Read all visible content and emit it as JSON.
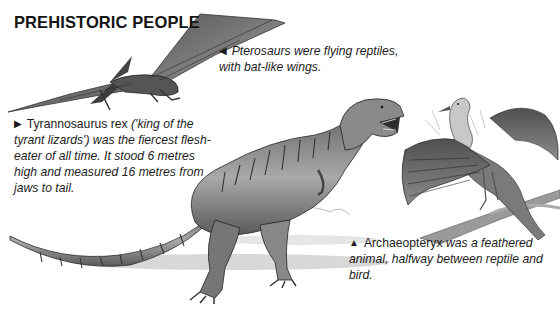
{
  "page": {
    "title": "PREHISTORIC PEOPLE"
  },
  "captions": {
    "pterosaur": {
      "marker": "◀",
      "marker_icon": "left-pointing-triangle-icon",
      "text": "Pterosaurs were flying reptiles, with bat-like wings."
    },
    "trex": {
      "marker": "▶",
      "marker_icon": "right-pointing-triangle-icon",
      "lead": "Tyrannosaurus rex",
      "text": " ('king of the tyrant lizards') was the fiercest flesh-eater of all time. It stood 6 metres high and measured 16 metres from jaws to tail."
    },
    "archaeopteryx": {
      "marker": "▲",
      "marker_icon": "up-pointing-triangle-icon",
      "lead": "Archaeopteryx",
      "text": " was a feathered animal, halfway between reptile and bird."
    }
  },
  "illustrations": [
    {
      "name": "pterosaur-illustration",
      "subject": "Pterosaur in flight"
    },
    {
      "name": "tyrannosaurus-illustration",
      "subject": "Tyrannosaurus rex"
    },
    {
      "name": "archaeopteryx-illustration",
      "subject": "Archaeopteryx perched on branch"
    }
  ],
  "colors": {
    "text": "#1c1c1c",
    "background": "#ffffff",
    "illustration_dark": "#3a3a3a",
    "illustration_mid": "#8a8a8a",
    "illustration_light": "#cfcfcf"
  }
}
